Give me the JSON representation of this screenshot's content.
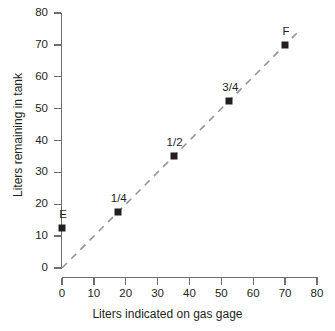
{
  "chart_data": {
    "type": "scatter",
    "title": "",
    "xlabel": "Liters indicated on gas gage",
    "ylabel": "Liters remaining in tank",
    "xlim": [
      0,
      80
    ],
    "ylim": [
      0,
      80
    ],
    "xticks": [
      0,
      10,
      20,
      30,
      40,
      50,
      60,
      70,
      80
    ],
    "yticks": [
      0,
      10,
      20,
      30,
      40,
      50,
      60,
      70,
      80
    ],
    "grid": false,
    "legend": "none",
    "marker_color": "#231f20",
    "line_color": "#939598",
    "axis_color": "#6d6e70",
    "points": [
      {
        "label": "E",
        "x": 0,
        "y": 12.5
      },
      {
        "label": "1/4",
        "x": 17.5,
        "y": 17.5
      },
      {
        "label": "1/2",
        "x": 35,
        "y": 35
      },
      {
        "label": "3/4",
        "x": 52.5,
        "y": 52.5
      },
      {
        "label": "F",
        "x": 70,
        "y": 70
      }
    ],
    "trend_line": {
      "style": "dashed",
      "from": {
        "x": 0,
        "y": 0
      },
      "to": {
        "x": 74,
        "y": 74
      }
    }
  }
}
